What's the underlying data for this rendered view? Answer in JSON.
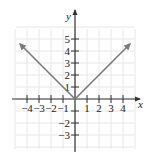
{
  "chart_data": {
    "type": "line",
    "title": "",
    "xlabel": "x",
    "ylabel": "y",
    "xlim": [
      -5,
      5
    ],
    "ylim": [
      -4,
      6
    ],
    "grid": true,
    "x_ticks": [
      -4,
      -3,
      -2,
      -1,
      1,
      2,
      3,
      4
    ],
    "x_tick_labels": [
      "−4",
      "−3",
      "−2",
      "−1",
      "1",
      "2",
      "3",
      "4"
    ],
    "y_ticks": [
      -3,
      -2,
      -1,
      1,
      2,
      3,
      4,
      5
    ],
    "y_tick_labels": [
      "−3",
      "−2",
      "",
      "1",
      "2",
      "3",
      "4",
      "5"
    ],
    "series": [
      {
        "name": "y = |x|",
        "points": [
          [
            -4.6,
            4.6
          ],
          [
            0,
            0
          ],
          [
            4.6,
            4.6
          ]
        ],
        "arrows": "both-ends",
        "color": "#7a7a7a"
      }
    ],
    "colors": {
      "grid": "#e6e6e6",
      "axis": "#333333",
      "curve": "#7a7a7a"
    }
  }
}
